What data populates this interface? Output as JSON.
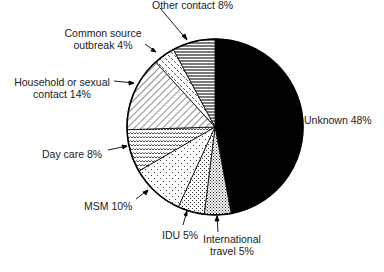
{
  "chart_data": {
    "type": "pie",
    "title": "",
    "start_angle_deg": 0,
    "direction": "clockwise",
    "categories": [
      "Unknown",
      "International travel",
      "IDU",
      "MSM",
      "Day care",
      "Household or sexual contact",
      "Common source outbreak",
      "Other contact"
    ],
    "values": [
      48,
      5,
      5,
      10,
      8,
      14,
      4,
      8
    ],
    "unit": "%",
    "fill_patterns": [
      "solid-black",
      "fine-dots-dense",
      "fine-dots",
      "sparse-dots",
      "wavy-lines",
      "diagonal-lines",
      "dashed-dots",
      "horizontal-lines"
    ],
    "labels": [
      {
        "line1": "Unknown 48%",
        "line2": ""
      },
      {
        "line1": "International",
        "line2": "travel 5%"
      },
      {
        "line1": "IDU 5%",
        "line2": ""
      },
      {
        "line1": "MSM 10%",
        "line2": ""
      },
      {
        "line1": "Day care 8%",
        "line2": ""
      },
      {
        "line1": "Household or sexual",
        "line2": "contact 14%"
      },
      {
        "line1": "Common source",
        "line2": "outbreak 4%"
      },
      {
        "line1": "Other contact 8%",
        "line2": ""
      }
    ]
  }
}
